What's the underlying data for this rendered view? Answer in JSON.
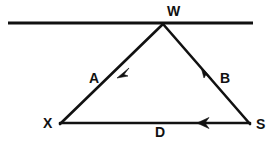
{
  "figure": {
    "kind": "geometry-diagram",
    "background_color": "#ffffff",
    "stroke_color": "#111111",
    "label_color": "#111111"
  },
  "transversal": {
    "name": "horizontal-line",
    "x1": 8,
    "y1": 23,
    "x2": 253,
    "y2": 23,
    "stroke_width": 3
  },
  "vertices": [
    {
      "id": "W",
      "label": "W",
      "x": 163,
      "y": 24
    },
    {
      "id": "X",
      "label": "X",
      "x": 60,
      "y": 124
    },
    {
      "id": "S",
      "label": "S",
      "x": 250,
      "y": 124
    }
  ],
  "segments": [
    {
      "id": "A",
      "label": "A",
      "from": "W",
      "to": "X",
      "x1": 163,
      "y1": 24,
      "x2": 60,
      "y2": 124,
      "arrow_at_x": 121,
      "arrow_at_y": 72,
      "arrow_direction": "down-left",
      "stroke_width": 2.6
    },
    {
      "id": "B",
      "label": "B",
      "from": "S",
      "to": "W",
      "x1": 250,
      "y1": 124,
      "x2": 163,
      "y2": 24,
      "arrow_at_x": 206,
      "arrow_at_y": 73,
      "arrow_direction": "up-left",
      "stroke_width": 2.6
    },
    {
      "id": "D",
      "label": "D",
      "from": "S",
      "to": "X",
      "x1": 250,
      "y1": 123,
      "x2": 60,
      "y2": 123,
      "arrow_at_x": 203,
      "arrow_at_y": 123,
      "arrow_direction": "left",
      "stroke_width": 2.6
    }
  ]
}
